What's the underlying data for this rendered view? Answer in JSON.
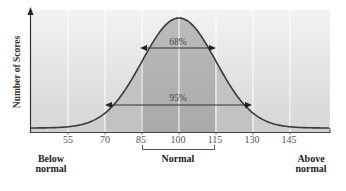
{
  "chart_data": {
    "type": "area",
    "title": "",
    "xlabel": "",
    "ylabel": "Number of Scores",
    "x_ticks": [
      55,
      70,
      85,
      100,
      115,
      130,
      145
    ],
    "xlim": [
      45,
      160
    ],
    "distribution": {
      "kind": "normal",
      "mean": 100,
      "sd": 15
    },
    "grid": {
      "vertical": true,
      "horizontal": false
    },
    "annotations": [
      {
        "label": "68%",
        "from": 85,
        "to": 115,
        "meaning": "scores within 1 SD of mean"
      },
      {
        "label": "95%",
        "from": 70,
        "to": 130,
        "meaning": "scores within 2 SD of mean"
      }
    ],
    "categories": [
      {
        "label": "Below normal",
        "range": [
          null,
          70
        ]
      },
      {
        "label": "Normal",
        "range": [
          85,
          115
        ]
      },
      {
        "label": "Above normal",
        "range": [
          130,
          null
        ]
      }
    ],
    "legend": null
  },
  "labels": {
    "y_axis": "Number of Scores",
    "ticks": [
      "55",
      "70",
      "85",
      "100",
      "115",
      "130",
      "145"
    ],
    "pct_inner": "68%",
    "pct_outer": "95%",
    "below_1": "Below",
    "below_2": "normal",
    "normal": "Normal",
    "above_1": "Above",
    "above_2": "normal"
  },
  "colors": {
    "background_light": "#ececec",
    "background_edge": "#d9d9d9",
    "band_2sd": "#c9c9c9",
    "band_1sd": "#b8b8b8",
    "curve": "#3a3a3a",
    "gridline": "#ffffff",
    "axis": "#333333"
  }
}
